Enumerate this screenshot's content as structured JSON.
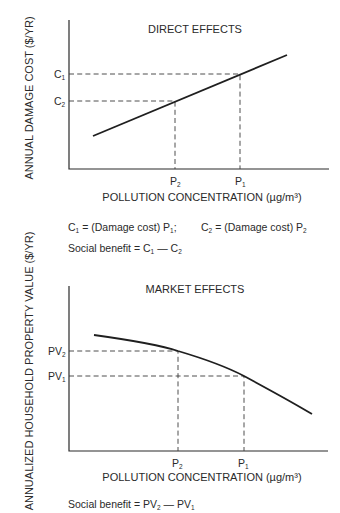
{
  "diagram": {
    "top_panel": {
      "title": "DIRECT EFFECTS",
      "y_axis_label": "ANNUAL DAMAGE COST ($/YR)",
      "x_axis_label": "POLLUTION CONCENTRATION (µg/m³)",
      "y_ticks": [
        {
          "label": "C",
          "sub": "1"
        },
        {
          "label": "C",
          "sub": "2"
        }
      ],
      "x_ticks": [
        {
          "label": "P",
          "sub": "2"
        },
        {
          "label": "P",
          "sub": "1"
        }
      ],
      "curve": "rising straight line",
      "definition_line": {
        "part1_lhs": "C",
        "part1_lhs_sub": "1",
        "part1_rhs": "= (Damage cost) P",
        "part1_rhs_sub": "1",
        "separator": ";",
        "part2_lhs": "C",
        "part2_lhs_sub": "2",
        "part2_rhs": "= (Damage cost) P",
        "part2_rhs_sub": "2"
      },
      "social_benefit": {
        "prefix": "Social benefit = C",
        "sub_a": "1",
        "mid": " — C",
        "sub_b": "2"
      }
    },
    "bottom_panel": {
      "title": "MARKET EFFECTS",
      "y_axis_label": "ANNUALIZED HOUSEHOLD PROPERTY VALUE ($/YR)",
      "x_axis_label": "POLLUTION CONCENTRATION (µg/m³)",
      "y_ticks": [
        {
          "label": "PV",
          "sub": "2"
        },
        {
          "label": "PV",
          "sub": "1"
        }
      ],
      "x_ticks": [
        {
          "label": "P",
          "sub": "2"
        },
        {
          "label": "P",
          "sub": "1"
        }
      ],
      "curve": "concave declining curve",
      "social_benefit": {
        "prefix": "Social benefit = PV",
        "sub_a": "2",
        "mid": " — PV",
        "sub_b": "1"
      }
    }
  }
}
